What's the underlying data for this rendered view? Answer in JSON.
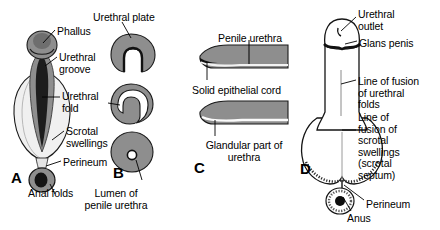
{
  "figure": {
    "background_color": "#ffffff",
    "ink_color": "#000000",
    "fill_mid_gray": "#8e8e8e",
    "fill_dark_gray": "#5a5a5a",
    "fill_light_gray": "#e8e8e8",
    "width": 440,
    "height": 230
  },
  "panels": [
    {
      "letter": "A",
      "name": "indifferent-external-genitalia",
      "letter_x": 11,
      "letter_y": 170,
      "labels": [
        {
          "text": "Phallus",
          "x": 57,
          "y": 26,
          "align": "left"
        },
        {
          "text": "Urethral\ngroove",
          "x": 59,
          "y": 52,
          "align": "left"
        },
        {
          "text": "Urethral\nfold",
          "x": 62,
          "y": 91,
          "align": "left"
        },
        {
          "text": "Scrotal\nswellings",
          "x": 66,
          "y": 126,
          "align": "left"
        },
        {
          "text": "Perineum",
          "x": 63,
          "y": 157,
          "align": "left"
        },
        {
          "text": "Anal folds",
          "x": 28,
          "y": 188,
          "align": "left"
        }
      ]
    },
    {
      "letter": "B",
      "name": "transverse-sections-of-phallus",
      "letter_x": 113,
      "letter_y": 165,
      "labels": [
        {
          "text": "Urethral plate",
          "x": 93,
          "y": 12,
          "align": "left"
        },
        {
          "text": "Lumen of\npenile urethra",
          "x": 116,
          "y": 188,
          "align": "center"
        }
      ]
    },
    {
      "letter": "C",
      "name": "sagittal-sections-of-glans",
      "letter_x": 194,
      "letter_y": 160,
      "labels": [
        {
          "text": "Penile urethra",
          "x": 218,
          "y": 33,
          "align": "left"
        },
        {
          "text": "Solid epithelial cord",
          "x": 192,
          "y": 85,
          "align": "left"
        },
        {
          "text": "Glandular part of\nurethra",
          "x": 196,
          "y": 140,
          "align": "left"
        }
      ]
    },
    {
      "letter": "D",
      "name": "definitive-external-genitalia",
      "letter_x": 300,
      "letter_y": 161,
      "labels": [
        {
          "text": "Urethral\noutlet",
          "x": 358,
          "y": 9,
          "align": "left"
        },
        {
          "text": "Glans penis",
          "x": 359,
          "y": 38,
          "align": "left"
        },
        {
          "text": "Line of fusion\nof urethral\nfolds",
          "x": 358,
          "y": 76,
          "align": "left"
        },
        {
          "text": "Line of\nfusion of\nscrotal\nswellings\n(scrotal\nseptum)",
          "x": 358,
          "y": 112,
          "align": "left"
        },
        {
          "text": "Perineum",
          "x": 366,
          "y": 199,
          "align": "left"
        },
        {
          "text": "Anus",
          "x": 347,
          "y": 213,
          "align": "left"
        }
      ]
    }
  ]
}
